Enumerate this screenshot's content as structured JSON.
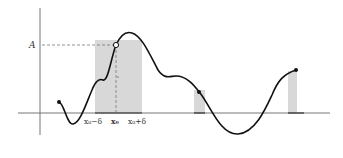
{
  "figure": {
    "labels": {
      "A": "A",
      "x0_minus": "x₀−δ",
      "x0": "x₀",
      "x0_plus": "x₀+δ"
    },
    "colors": {
      "curve": "#111111",
      "shade": "#d8d8d8",
      "axis": "#555555"
    }
  }
}
